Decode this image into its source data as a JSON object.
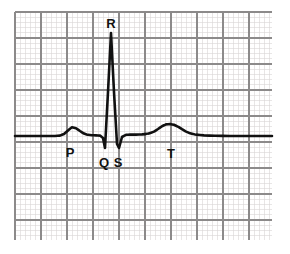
{
  "figure": {
    "background_color": "#ffffff",
    "trace_color": "#111111",
    "grid_minor_color": "#d9d5d5",
    "grid_major_color": "#8c8a8a",
    "trace_width": 2.6
  },
  "grid": {
    "x_start": 15,
    "y_start": 12,
    "x_end": 272,
    "y_end": 240,
    "minor_step": 5.2,
    "major_every": 5,
    "major_step": 26,
    "minor_count_x": 50,
    "minor_count_y": 44
  },
  "labels": [
    {
      "text": "R",
      "x": 111,
      "y": 28
    },
    {
      "text": "P",
      "x": 70,
      "y": 157
    },
    {
      "text": "Q",
      "x": 104,
      "y": 167
    },
    {
      "text": "S",
      "x": 118,
      "y": 167
    },
    {
      "text": "T",
      "x": 171,
      "y": 158
    }
  ],
  "chart_data": {
    "type": "line",
    "xlabel": "",
    "ylabel": "",
    "grid": true,
    "legend": null,
    "baseline_y": 136,
    "annotations": [
      {
        "label": "P",
        "description": "P wave - atrial depolarization",
        "peak_x": 72,
        "peak_y": 127,
        "amplitude_px": 9
      },
      {
        "label": "Q",
        "description": "Q wave - initial negative deflection",
        "peak_x": 105,
        "peak_y": 148,
        "amplitude_px": -12
      },
      {
        "label": "R",
        "description": "R wave - tall positive spike",
        "peak_x": 111,
        "peak_y": 33,
        "amplitude_px": 103
      },
      {
        "label": "S",
        "description": "S wave - negative deflection after R",
        "peak_x": 119,
        "peak_y": 148,
        "amplitude_px": -12
      },
      {
        "label": "T",
        "description": "T wave - ventricular repolarization",
        "peak_x": 170,
        "peak_y": 124,
        "amplitude_px": 12
      }
    ],
    "x": [
      15,
      30,
      45,
      55,
      60,
      64,
      68,
      72,
      76,
      80,
      84,
      88,
      92,
      96,
      100,
      103,
      105,
      108,
      111,
      114,
      117,
      119,
      122,
      126,
      130,
      136,
      142,
      148,
      154,
      158,
      162,
      166,
      170,
      174,
      178,
      182,
      186,
      190,
      196,
      204,
      215,
      230,
      250,
      272
    ],
    "y": [
      136,
      136,
      136,
      136,
      135.6,
      134,
      130.5,
      127.2,
      128.2,
      131,
      133.6,
      134.8,
      135.2,
      135.4,
      135.6,
      138,
      148,
      92,
      33,
      92,
      144,
      148,
      137,
      134.8,
      134.6,
      134.6,
      134.4,
      133.8,
      131.6,
      129,
      126.2,
      124.4,
      124,
      124.8,
      126.6,
      129.2,
      131.6,
      133.2,
      134.6,
      135.4,
      135.8,
      136,
      136,
      136
    ],
    "series": [
      {
        "name": "ECG trace",
        "points": [
          [
            15,
            136
          ],
          [
            30,
            136
          ],
          [
            45,
            136
          ],
          [
            55,
            136
          ],
          [
            60,
            135.6
          ],
          [
            64,
            134
          ],
          [
            68,
            130.5
          ],
          [
            72,
            127.2
          ],
          [
            76,
            128.2
          ],
          [
            80,
            131
          ],
          [
            84,
            133.6
          ],
          [
            88,
            134.8
          ],
          [
            92,
            135.2
          ],
          [
            96,
            135.4
          ],
          [
            100,
            135.6
          ],
          [
            103,
            138
          ],
          [
            105,
            148
          ],
          [
            108,
            92
          ],
          [
            111,
            33
          ],
          [
            114,
            92
          ],
          [
            117,
            144
          ],
          [
            119,
            148
          ],
          [
            122,
            137
          ],
          [
            126,
            134.8
          ],
          [
            130,
            134.6
          ],
          [
            136,
            134.6
          ],
          [
            142,
            134.4
          ],
          [
            148,
            133.8
          ],
          [
            154,
            131.6
          ],
          [
            158,
            129
          ],
          [
            162,
            126.2
          ],
          [
            166,
            124.4
          ],
          [
            170,
            124
          ],
          [
            174,
            124.8
          ],
          [
            178,
            126.6
          ],
          [
            182,
            129.2
          ],
          [
            186,
            131.6
          ],
          [
            190,
            133.2
          ],
          [
            196,
            134.6
          ],
          [
            204,
            135.4
          ],
          [
            215,
            135.8
          ],
          [
            230,
            136
          ],
          [
            250,
            136
          ],
          [
            272,
            136
          ]
        ]
      }
    ]
  }
}
